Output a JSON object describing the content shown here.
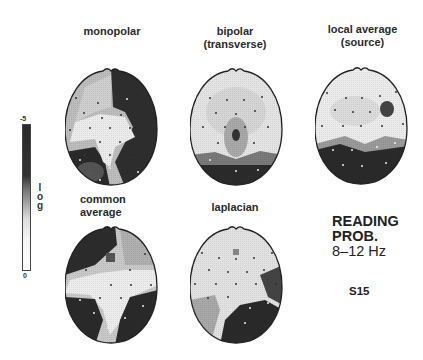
{
  "figure": {
    "maps": [
      {
        "id": "monopolar",
        "label": "monopolar",
        "label_line2": ""
      },
      {
        "id": "bipolar",
        "label": "bipolar",
        "label_line2": "(transverse)"
      },
      {
        "id": "local-average",
        "label": "local average",
        "label_line2": "(source)"
      },
      {
        "id": "common-average",
        "label": "common",
        "label_line2": "average"
      },
      {
        "id": "laplacian",
        "label": "laplacian",
        "label_line2": ""
      }
    ],
    "colorbar": {
      "top_tick": "-5",
      "bottom_tick": "0",
      "scale_label": [
        "l",
        "o",
        "g"
      ]
    },
    "annotation": {
      "line1": "READING",
      "line2": "PROB.",
      "line3": "8–12 Hz",
      "subject": "S15"
    }
  }
}
